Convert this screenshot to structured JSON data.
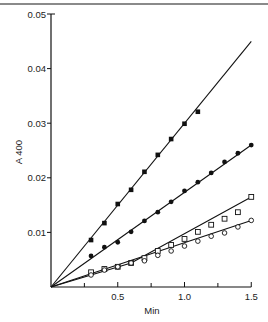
{
  "chart_data": {
    "type": "scatter",
    "title": "",
    "xlabel": "Min",
    "ylabel": "A 400",
    "xlim": [
      0,
      1.5
    ],
    "ylim": [
      0,
      0.05
    ],
    "grid": false,
    "legend": null,
    "x_ticks": [
      0.5,
      1.0,
      1.5
    ],
    "x_tick_labels": [
      "0.5",
      "1.0",
      "1.5"
    ],
    "x_minor_ticks": [
      0.25,
      0.75,
      1.25
    ],
    "y_ticks": [
      0.01,
      0.02,
      0.03,
      0.04,
      0.05
    ],
    "y_tick_labels": [
      "0.01",
      "0.02",
      "0.03",
      "0.04",
      "0.05"
    ],
    "series": [
      {
        "name": "filled-squares",
        "marker": "filled-square",
        "x": [
          0.3,
          0.4,
          0.5,
          0.6,
          0.7,
          0.8,
          0.9,
          1.0,
          1.1
        ],
        "values": [
          0.0086,
          0.0117,
          0.0152,
          0.0178,
          0.0211,
          0.0242,
          0.0271,
          0.0299,
          0.0321
        ],
        "fit_line": [
          [
            0,
            0
          ],
          [
            1.5,
            0.045
          ]
        ]
      },
      {
        "name": "filled-circles",
        "marker": "filled-circle",
        "x": [
          0.3,
          0.4,
          0.5,
          0.6,
          0.7,
          0.8,
          0.9,
          1.0,
          1.1,
          1.2,
          1.3,
          1.4,
          1.5
        ],
        "values": [
          0.0057,
          0.0073,
          0.0082,
          0.0101,
          0.0121,
          0.0137,
          0.0156,
          0.0176,
          0.0192,
          0.0209,
          0.0229,
          0.0245,
          0.026
        ],
        "fit_line": [
          [
            0,
            0
          ],
          [
            1.5,
            0.026
          ]
        ]
      },
      {
        "name": "open-squares",
        "marker": "open-square",
        "x": [
          0.3,
          0.4,
          0.5,
          0.6,
          0.7,
          0.8,
          0.9,
          1.0,
          1.1,
          1.2,
          1.3,
          1.4,
          1.5
        ],
        "values": [
          0.0027,
          0.0033,
          0.0037,
          0.0044,
          0.0053,
          0.0066,
          0.0077,
          0.0088,
          0.0101,
          0.0114,
          0.0125,
          0.0137,
          0.0165
        ],
        "fit_line": [
          [
            0,
            0
          ],
          [
            0.6,
            0.0044
          ],
          [
            1.5,
            0.0165
          ]
        ]
      },
      {
        "name": "open-circles",
        "marker": "open-circle",
        "x": [
          0.3,
          0.4,
          0.5,
          0.6,
          0.7,
          0.8,
          0.9,
          1.0,
          1.1,
          1.2,
          1.3,
          1.4,
          1.5
        ],
        "values": [
          0.0022,
          0.0031,
          0.0037,
          0.0044,
          0.0048,
          0.0058,
          0.0066,
          0.0075,
          0.0084,
          0.0093,
          0.0099,
          0.011,
          0.0122
        ],
        "fit_line": [
          [
            0,
            0
          ],
          [
            1.5,
            0.0122
          ]
        ]
      }
    ]
  },
  "layout": {
    "origin_px": [
      51,
      287
    ],
    "px_per_x_unit": 133.5,
    "px_per_y_unit": 5460,
    "top_rule_color": "#888888",
    "ink_color": "#111111"
  }
}
